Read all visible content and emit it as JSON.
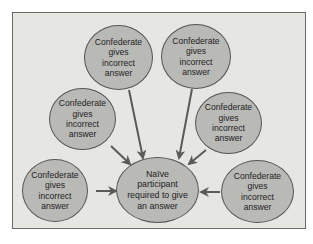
{
  "diagram": {
    "type": "hub-and-spoke",
    "center": {
      "label": "Naïve\nparticipant\nrequired to give\nan answer"
    },
    "confederates": [
      {
        "position": "top-left",
        "label": "Confederate\ngives\nincorrect\nanswer"
      },
      {
        "position": "top-right",
        "label": "Confederate\ngives\nincorrect\nanswer"
      },
      {
        "position": "middle-left",
        "label": "Confederate\ngives\nincorrect\nanswer"
      },
      {
        "position": "middle-right",
        "label": "Confederate\ngives\nincorrect\nanswer"
      },
      {
        "position": "bottom-left",
        "label": "Confederate\ngives\nincorrect\nanswer"
      },
      {
        "position": "bottom-right",
        "label": "Confederate\ngives\nincorrect\nanswer"
      }
    ],
    "edges": [
      {
        "from": "top-left",
        "to": "center"
      },
      {
        "from": "top-right",
        "to": "center"
      },
      {
        "from": "middle-left",
        "to": "center"
      },
      {
        "from": "middle-right",
        "to": "center"
      },
      {
        "from": "bottom-left",
        "to": "center"
      },
      {
        "from": "bottom-right",
        "to": "center"
      }
    ],
    "colors": {
      "background": "#e6e6e3",
      "node_fill": "#b9b9b6",
      "node_border": "#555555",
      "arrow": "#5a5a5a",
      "text": "#1e1e1e"
    }
  }
}
